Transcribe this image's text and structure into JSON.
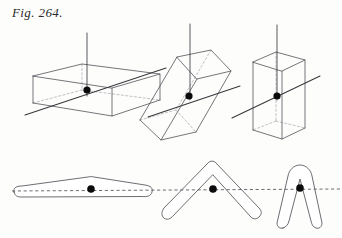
{
  "figure": {
    "caption": "Fig. 264.",
    "width": 342,
    "height": 238,
    "background_color": "#fdfdfc",
    "edge_color": "#555258",
    "hidden_edge_color": "#a9a6ab",
    "axis_color": "#39363c",
    "dot_color": "#0b0b0c"
  },
  "top_row": {
    "label": "three-dimensional-prisms",
    "items": [
      {
        "name": "flat-slab-prism",
        "shape_kind": "rectangular slab, wide and shallow, viewed in oblique projection",
        "center_dot": {
          "cx": 87,
          "cy": 90,
          "r": 3.6
        },
        "vertical_axis": {
          "x": 87,
          "y_top": 33,
          "y_bottom": 96
        },
        "oblique_axis": {
          "x1": 25,
          "y1": 115,
          "x2": 166,
          "y2": 68
        },
        "visible_edges": [
          "M33,76 L82,64 L160,74 L112,88 Z",
          "M33,76 L33,103",
          "M112,88 L112,116",
          "M160,74 L160,100",
          "M33,103 L112,116 L160,100"
        ],
        "hidden_edges": [
          "M82,64 L82,90",
          "M82,90 L33,103",
          "M82,90 L160,100"
        ]
      },
      {
        "name": "tilted-elongated-prism",
        "shape_kind": "elongated rectangular prism inclined to the left",
        "center_dot": {
          "cx": 189,
          "cy": 96,
          "r": 3.6
        },
        "vertical_axis": {
          "x": 190,
          "y_top": 24,
          "y_bottom": 100
        },
        "oblique_axis": {
          "x1": 148,
          "y1": 117,
          "x2": 240,
          "y2": 86
        },
        "visible_edges": [
          "M177,57 L211,50 L231,71 L197,79 Z",
          "M177,57 L140,120",
          "M197,79 L161,140",
          "M231,71 L196,132",
          "M140,120 L161,140 L196,132"
        ],
        "hidden_edges": [
          "M211,50 L176,110",
          "M176,110 L140,120",
          "M176,110 L196,132"
        ]
      },
      {
        "name": "upright-tall-prism",
        "shape_kind": "tall upright rectangular prism (column)",
        "center_dot": {
          "cx": 277,
          "cy": 96,
          "r": 3.6
        },
        "vertical_axis": {
          "x": 277,
          "y_top": 25,
          "y_bottom": 100
        },
        "oblique_axis": {
          "x1": 232,
          "y1": 118,
          "x2": 320,
          "y2": 76
        },
        "visible_edges": [
          "M253,62 L276,52 L305,60 L282,71 Z",
          "M253,62 L253,130",
          "M282,71 L282,139",
          "M305,60 L305,128",
          "M253,130 L282,139 L305,128"
        ],
        "hidden_edges": [
          "M276,52 L276,121",
          "M276,121 L253,130",
          "M276,121 L305,128"
        ]
      }
    ]
  },
  "bottom_row": {
    "label": "plane-boomerang-figures",
    "shared_axis": {
      "name": "horizontal-dashed-axis",
      "x1": 12,
      "y1": 191,
      "x2": 340,
      "y2": 189
    },
    "items": [
      {
        "name": "shallow-flat-boomerang",
        "shape_kind": "very shallow elongated boomerang, almost straight",
        "center_dot": {
          "cx": 91,
          "cy": 189,
          "r": 3.8
        },
        "outline": "M14,192 C13,188 16,186 22,186 L88,177 C90,176.5 92,176.5 94,177 L145,185 C151,186 153,188 152,192 C151,196 147,197 142,196.5 L22,197 C17,197 15,196 14,192 Z"
      },
      {
        "name": "open-v-boomerang",
        "shape_kind": "wide V-shaped boomerang, apex uppermost",
        "center_dot": {
          "cx": 213,
          "cy": 189,
          "r": 3.8
        },
        "outline": "M172,217 C169,220 165,220 163,217 C161,214 162,211 164,208 L208,163 C210,160.5 214,160.5 216,163 L259,208 C262,211 262,214 259,217 C256,220 252,219 250,216 L213,175 Z"
      },
      {
        "name": "narrow-hairpin-boomerang",
        "shape_kind": "narrow tall hairpin, nearly closed arms",
        "center_dot": {
          "cx": 300,
          "cy": 188,
          "r": 3.8
        },
        "outline": "M283,228 C280,229 277,227 277,223 L288,176 C289,170 294,165 300,165 C306,165 311,170 312,176 L322,223 C322,227 319,229 316,228 C313,227 312,225 311,221 L300,179 L289,221 C288,225 286,227 283,228 Z"
      }
    ]
  }
}
